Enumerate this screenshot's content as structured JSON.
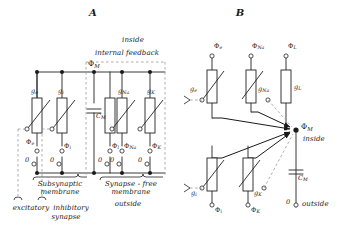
{
  "figure": {
    "panels": [
      {
        "id": "A",
        "label": "A"
      },
      {
        "id": "B",
        "label": "B"
      }
    ],
    "colors": {
      "ink": "#1a1a1a",
      "wire": "#222222",
      "dashed": "#8a8a8a",
      "background": "#ffffff"
    }
  },
  "panel_a": {
    "letter": "A",
    "top_labels": {
      "inside": "inside",
      "internal_feedback": "internal feedback",
      "membrane_potential": "Φ",
      "membrane_potential_sub": "M"
    },
    "capacitor": {
      "symbol": "C",
      "sub": "M",
      "name": "membrane-capacitance"
    },
    "branches": [
      {
        "conductance": "g",
        "conductance_sub": "e",
        "battery": "Φ",
        "battery_sub": "e",
        "ground": "0",
        "variable": true
      },
      {
        "conductance": "g",
        "conductance_sub": "i",
        "battery": "Φ",
        "battery_sub": "i",
        "ground": "0",
        "variable": true
      },
      {
        "conductance": "",
        "conductance_sub": "",
        "battery": "Φ",
        "battery_sub": "l",
        "ground": "0",
        "variable": false
      },
      {
        "conductance": "g",
        "conductance_sub": "Na",
        "battery": "Φ",
        "battery_sub": "Na",
        "ground": "0",
        "variable": true
      },
      {
        "conductance": "g",
        "conductance_sub": "K",
        "battery": "Φ",
        "battery_sub": "K",
        "ground": "0",
        "variable": true
      }
    ],
    "brackets": {
      "subsynaptic": "Subsynaptic\nmembrane",
      "subsynaptic_line1": "Subsynaptic",
      "subsynaptic_line2": "membrane",
      "synapse_free_line1": "Synapse - free",
      "synapse_free_line2": "membrane",
      "excitatory": "excitatory",
      "inhibitory_line1": "inhibitory",
      "inhibitory_line2": "synapse",
      "outside": "outside"
    }
  },
  "panel_b": {
    "letter": "B",
    "center_node": {
      "symbol": "Φ",
      "sub": "M",
      "side_label": "inside"
    },
    "outside_label": "outside",
    "ground_value": "0",
    "capacitor": {
      "symbol": "C",
      "sub": "M"
    },
    "top_branches": [
      {
        "battery": "Φ",
        "battery_sub": "e",
        "conductance": "g",
        "conductance_sub": "e",
        "variable": true
      },
      {
        "battery": "Φ",
        "battery_sub": "Na",
        "conductance": "g",
        "conductance_sub": "Na",
        "variable": true
      },
      {
        "battery": "Φ",
        "battery_sub": "L",
        "conductance": "g",
        "conductance_sub": "L",
        "variable": false
      }
    ],
    "bottom_branches": [
      {
        "battery": "Φ",
        "battery_sub": "i",
        "conductance": "g",
        "conductance_sub": "i",
        "variable": true
      },
      {
        "battery": "Φ",
        "battery_sub": "K",
        "conductance": "g",
        "conductance_sub": "K",
        "variable": true
      }
    ]
  }
}
